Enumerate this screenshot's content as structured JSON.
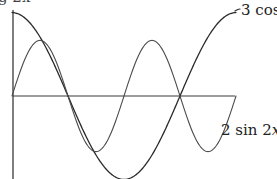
{
  "caption": "g 2x",
  "labels": {
    "cos_prefix": "3 cos ",
    "cos_var": "x",
    "sin_prefix": "2 sin 2",
    "sin_var": "x"
  },
  "colors": {
    "axis": "#3a3a3a",
    "cos_curve": "#2a2a2a",
    "sin_curve": "#4a4a4a",
    "text": "#222222"
  },
  "chart_data": {
    "type": "line",
    "title": "",
    "xlabel": "",
    "ylabel": "",
    "x_range": [
      0,
      6.2832
    ],
    "y_range": [
      -3,
      3
    ],
    "grid": false,
    "legend": "inline labels at right end of curves",
    "series": [
      {
        "name": "3 cos x",
        "function": "3*cos(x)",
        "x": [
          0,
          0.7854,
          1.5708,
          2.3562,
          3.1416,
          3.927,
          4.7124,
          5.4978,
          6.2832
        ],
        "values": [
          3,
          2.12,
          0,
          -2.12,
          -3,
          -2.12,
          0,
          2.12,
          3
        ]
      },
      {
        "name": "2 sin 2x",
        "function": "2*sin(2*x)",
        "x": [
          0,
          0.7854,
          1.5708,
          2.3562,
          3.1416,
          3.927,
          4.7124,
          5.4978,
          6.2832
        ],
        "values": [
          0,
          2,
          0,
          -2,
          0,
          2,
          0,
          -2,
          0
        ]
      }
    ]
  }
}
